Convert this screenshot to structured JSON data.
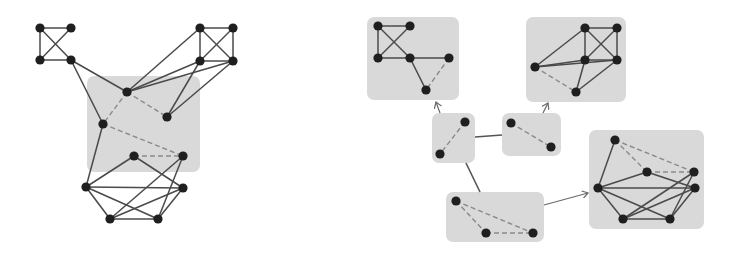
{
  "figure": {
    "colors": {
      "node": "#1f1f1f",
      "edge": "#4a4a4a",
      "dashed_edge": "#8a8a8a",
      "group_fill": "#d9d9d9",
      "background": "#ffffff"
    },
    "left_graph": {
      "group_boxes": [
        {
          "x": 87,
          "y": 76,
          "w": 113,
          "h": 96
        }
      ],
      "nodes": [
        {
          "id": "a1",
          "x": 40,
          "y": 28
        },
        {
          "id": "a2",
          "x": 71,
          "y": 28
        },
        {
          "id": "a3",
          "x": 40,
          "y": 60
        },
        {
          "id": "a4",
          "x": 71,
          "y": 60
        },
        {
          "id": "b1",
          "x": 200,
          "y": 28
        },
        {
          "id": "b2",
          "x": 233,
          "y": 28
        },
        {
          "id": "b3",
          "x": 200,
          "y": 61
        },
        {
          "id": "b4",
          "x": 233,
          "y": 61
        },
        {
          "id": "c1",
          "x": 127,
          "y": 92
        },
        {
          "id": "c2",
          "x": 167,
          "y": 117
        },
        {
          "id": "c3",
          "x": 103,
          "y": 124
        },
        {
          "id": "c4",
          "x": 134,
          "y": 156
        },
        {
          "id": "c5",
          "x": 183,
          "y": 156
        },
        {
          "id": "d1",
          "x": 86,
          "y": 187
        },
        {
          "id": "d2",
          "x": 183,
          "y": 188
        },
        {
          "id": "d3",
          "x": 110,
          "y": 219
        },
        {
          "id": "d4",
          "x": 158,
          "y": 219
        }
      ],
      "edges": [
        [
          "a1",
          "a2"
        ],
        [
          "a1",
          "a3"
        ],
        [
          "a1",
          "a4"
        ],
        [
          "a2",
          "a3"
        ],
        [
          "a3",
          "a4"
        ],
        [
          "b1",
          "b2"
        ],
        [
          "b1",
          "b3"
        ],
        [
          "b1",
          "b4"
        ],
        [
          "b2",
          "b3"
        ],
        [
          "b2",
          "b4"
        ],
        [
          "b3",
          "b4"
        ],
        [
          "a4",
          "c1"
        ],
        [
          "a4",
          "c3"
        ],
        [
          "b1",
          "c1"
        ],
        [
          "b3",
          "c1"
        ],
        [
          "b4",
          "c1"
        ],
        [
          "b3",
          "c2"
        ],
        [
          "b4",
          "c2"
        ],
        [
          "c3",
          "d1"
        ],
        [
          "c4",
          "d1"
        ],
        [
          "c4",
          "d2"
        ],
        [
          "c5",
          "d3"
        ],
        [
          "c5",
          "d4"
        ],
        [
          "d1",
          "d2"
        ],
        [
          "d1",
          "d3"
        ],
        [
          "d1",
          "d4"
        ],
        [
          "d2",
          "d3"
        ],
        [
          "d3",
          "d4"
        ],
        [
          "d2",
          "d4"
        ]
      ],
      "dashed_edges": [
        [
          "c1",
          "c2"
        ],
        [
          "c1",
          "c3"
        ],
        [
          "c3",
          "c5"
        ],
        [
          "c4",
          "c5"
        ]
      ]
    },
    "right_graph": {
      "group_boxes": [
        {
          "name": "cluster-top-left",
          "x": 367,
          "y": 17,
          "w": 92,
          "h": 83
        },
        {
          "name": "cluster-top-right",
          "x": 526,
          "y": 17,
          "w": 100,
          "h": 85
        },
        {
          "name": "separator-left",
          "x": 432,
          "y": 113,
          "w": 43,
          "h": 50
        },
        {
          "name": "separator-middle",
          "x": 502,
          "y": 113,
          "w": 59,
          "h": 43
        },
        {
          "name": "separator-bottom",
          "x": 446,
          "y": 192,
          "w": 98,
          "h": 50
        },
        {
          "name": "cluster-bottom-right",
          "x": 589,
          "y": 130,
          "w": 115,
          "h": 99
        }
      ],
      "nodes": [
        {
          "id": "p1",
          "x": 378,
          "y": 26
        },
        {
          "id": "p2",
          "x": 410,
          "y": 26
        },
        {
          "id": "p3",
          "x": 378,
          "y": 58
        },
        {
          "id": "p4",
          "x": 410,
          "y": 58
        },
        {
          "id": "p5",
          "x": 449,
          "y": 58
        },
        {
          "id": "p6",
          "x": 426,
          "y": 90
        },
        {
          "id": "q1",
          "x": 585,
          "y": 28
        },
        {
          "id": "q2",
          "x": 617,
          "y": 28
        },
        {
          "id": "q3",
          "x": 585,
          "y": 60
        },
        {
          "id": "q4",
          "x": 617,
          "y": 60
        },
        {
          "id": "q5",
          "x": 535,
          "y": 67
        },
        {
          "id": "q6",
          "x": 576,
          "y": 92
        },
        {
          "id": "s1",
          "x": 465,
          "y": 122
        },
        {
          "id": "s2",
          "x": 440,
          "y": 154
        },
        {
          "id": "m1",
          "x": 511,
          "y": 123
        },
        {
          "id": "m2",
          "x": 551,
          "y": 147
        },
        {
          "id": "t1",
          "x": 456,
          "y": 201
        },
        {
          "id": "t2",
          "x": 486,
          "y": 233
        },
        {
          "id": "t3",
          "x": 533,
          "y": 233
        },
        {
          "id": "r1",
          "x": 615,
          "y": 140
        },
        {
          "id": "r2",
          "x": 647,
          "y": 172
        },
        {
          "id": "r3",
          "x": 694,
          "y": 172
        },
        {
          "id": "r4",
          "x": 598,
          "y": 188
        },
        {
          "id": "r5",
          "x": 695,
          "y": 188
        },
        {
          "id": "r6",
          "x": 623,
          "y": 219
        },
        {
          "id": "r7",
          "x": 670,
          "y": 219
        }
      ],
      "edges": [
        [
          "p1",
          "p2"
        ],
        [
          "p1",
          "p3"
        ],
        [
          "p1",
          "p4"
        ],
        [
          "p2",
          "p3"
        ],
        [
          "p3",
          "p4"
        ],
        [
          "p4",
          "p5"
        ],
        [
          "p4",
          "p6"
        ],
        [
          "q1",
          "q2"
        ],
        [
          "q1",
          "q3"
        ],
        [
          "q1",
          "q4"
        ],
        [
          "q2",
          "q3"
        ],
        [
          "q2",
          "q4"
        ],
        [
          "q3",
          "q4"
        ],
        [
          "q5",
          "q1"
        ],
        [
          "q5",
          "q3"
        ],
        [
          "q5",
          "q4"
        ],
        [
          "q3",
          "q6"
        ],
        [
          "q4",
          "q6"
        ],
        [
          "r1",
          "r4"
        ],
        [
          "r2",
          "r4"
        ],
        [
          "r4",
          "r5"
        ],
        [
          "r4",
          "r6"
        ],
        [
          "r4",
          "r7"
        ],
        [
          "r2",
          "r5"
        ],
        [
          "r6",
          "r7"
        ],
        [
          "r6",
          "r3"
        ],
        [
          "r6",
          "r5"
        ],
        [
          "r7",
          "r3"
        ],
        [
          "r7",
          "r5"
        ]
      ],
      "dashed_edges": [
        [
          "p5",
          "p6"
        ],
        [
          "q5",
          "q6"
        ],
        [
          "s1",
          "s2"
        ],
        [
          "m1",
          "m2"
        ],
        [
          "t1",
          "t2"
        ],
        [
          "t1",
          "t3"
        ],
        [
          "t2",
          "t3"
        ],
        [
          "r1",
          "r2"
        ],
        [
          "r1",
          "r3"
        ],
        [
          "r2",
          "r3"
        ]
      ],
      "box_connections": [
        {
          "from": "separator-left",
          "to": "separator-middle",
          "x1": 475,
          "y1": 137,
          "x2": 502,
          "y2": 135
        },
        {
          "from": "separator-left",
          "to": "separator-bottom",
          "x1": 466,
          "y1": 163,
          "x2": 480,
          "y2": 192
        }
      ],
      "arrows": [
        {
          "from": "separator-left",
          "to": "cluster-top-left",
          "x1": 440,
          "y1": 113,
          "x2": 436,
          "y2": 102
        },
        {
          "from": "separator-middle",
          "to": "cluster-top-right",
          "x1": 543,
          "y1": 113,
          "x2": 548,
          "y2": 103
        },
        {
          "from": "separator-bottom",
          "to": "cluster-bottom-right",
          "x1": 544,
          "y1": 205,
          "x2": 588,
          "y2": 193
        }
      ]
    }
  }
}
